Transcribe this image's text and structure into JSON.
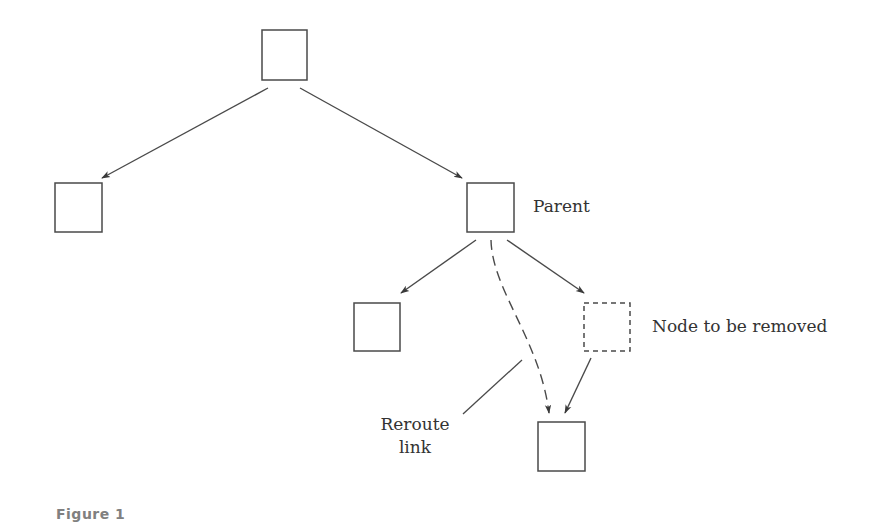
{
  "diagram": {
    "type": "tree-node-removal",
    "colors": {
      "stroke": "#4a4a4a",
      "text": "#333333",
      "caption": "#808080",
      "background": "#ffffff"
    },
    "nodes": [
      {
        "id": "root",
        "x": 262,
        "y": 30,
        "w": 45,
        "h": 50,
        "style": "solid",
        "label": ""
      },
      {
        "id": "left-child",
        "x": 55,
        "y": 183,
        "w": 47,
        "h": 49,
        "style": "solid",
        "label": ""
      },
      {
        "id": "parent",
        "x": 467,
        "y": 183,
        "w": 47,
        "h": 49,
        "style": "solid",
        "label": "Parent"
      },
      {
        "id": "left-grandchild",
        "x": 354,
        "y": 303,
        "w": 46,
        "h": 48,
        "style": "solid",
        "label": ""
      },
      {
        "id": "node-to-remove",
        "x": 584,
        "y": 303,
        "w": 46,
        "h": 48,
        "style": "dashed",
        "label": "Node to be removed"
      },
      {
        "id": "grandchild-of-removed",
        "x": 538,
        "y": 422,
        "w": 47,
        "h": 49,
        "style": "solid",
        "label": ""
      }
    ],
    "edges": [
      {
        "from": "root",
        "to": "left-child",
        "style": "solid"
      },
      {
        "from": "root",
        "to": "parent",
        "style": "solid"
      },
      {
        "from": "parent",
        "to": "left-grandchild",
        "style": "solid"
      },
      {
        "from": "parent",
        "to": "node-to-remove",
        "style": "solid"
      },
      {
        "from": "node-to-remove",
        "to": "grandchild-of-removed",
        "style": "solid"
      },
      {
        "from": "parent",
        "to": "grandchild-of-removed",
        "style": "dashed-curve",
        "label": "Reroute link"
      }
    ],
    "labels": {
      "parent": "Parent",
      "node_to_remove": "Node to be removed",
      "reroute_line1": "Reroute",
      "reroute_line2": "link"
    }
  },
  "caption": "Figure 1"
}
